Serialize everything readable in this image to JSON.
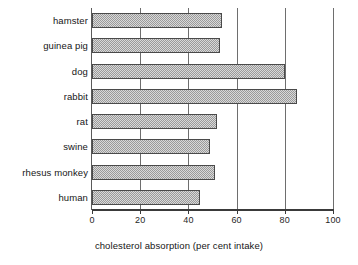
{
  "chart_data": {
    "type": "bar",
    "orientation": "horizontal",
    "title": "",
    "xlabel": "cholesterol absorption (per cent intake)",
    "ylabel": "",
    "xlim": [
      0,
      100
    ],
    "xticks": [
      0,
      20,
      40,
      60,
      80,
      100
    ],
    "xticklabels": [
      "0",
      "20",
      "40",
      "60",
      "80",
      "100"
    ],
    "grid": "vertical gridlines at each x tick",
    "legend": "none",
    "categories": [
      "hamster",
      "guinea pig",
      "dog",
      "rabbit",
      "rat",
      "swine",
      "rhesus monkey",
      "human"
    ],
    "values": [
      54,
      53,
      80,
      85,
      52,
      49,
      51,
      45
    ],
    "bars": [
      {
        "label": "hamster",
        "value": 54
      },
      {
        "label": "guinea pig",
        "value": 53
      },
      {
        "label": "dog",
        "value": 80
      },
      {
        "label": "rabbit",
        "value": 85
      },
      {
        "label": "rat",
        "value": 52
      },
      {
        "label": "swine",
        "value": 49
      },
      {
        "label": "rhesus monkey",
        "value": 51
      },
      {
        "label": "human",
        "value": 45
      }
    ],
    "colors": {
      "bar_fill": "#d9d9d9",
      "bar_hatch": "#9a9a9a",
      "bar_edge": "#4a4a4a",
      "axis": "#3a3a3a",
      "gridline": "#6e6e6e",
      "text": "#161616",
      "background": "#ffffff"
    }
  }
}
